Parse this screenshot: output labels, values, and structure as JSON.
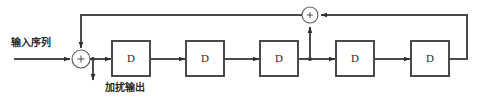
{
  "diagram": {
    "type": "scrambler-block-diagram",
    "title": "",
    "labels": {
      "input_sequence": "输入序列",
      "scrambled_output": "加扰输出"
    },
    "colors": {
      "background": "#ffffff",
      "wire": "#4a4a4a",
      "box_border": "#4a4a4a",
      "text": "#2a2a2a",
      "junction": "#2e2e2e"
    },
    "adders": [
      {
        "name": "input-adder",
        "sign": "+",
        "cx": 81,
        "cy": 59,
        "r": 9
      },
      {
        "name": "feedback-adder",
        "sign": "+",
        "cx": 310,
        "cy": 15,
        "r": 8
      }
    ],
    "delay_blocks": [
      {
        "name": "delay-1",
        "label": "D",
        "x": 112,
        "y": 41,
        "w": 38,
        "h": 35
      },
      {
        "name": "delay-2",
        "label": "D",
        "x": 186,
        "y": 41,
        "w": 38,
        "h": 35
      },
      {
        "name": "delay-3",
        "label": "D",
        "x": 260,
        "y": 41,
        "w": 38,
        "h": 35
      },
      {
        "name": "delay-4",
        "label": "D",
        "x": 336,
        "y": 41,
        "w": 38,
        "h": 35
      },
      {
        "name": "delay-5",
        "label": "D",
        "x": 411,
        "y": 41,
        "w": 38,
        "h": 35
      }
    ],
    "junctions": [
      {
        "name": "output-tap-junction",
        "cx": 93,
        "cy": 59
      },
      {
        "name": "stage3-tap-junction",
        "cx": 310,
        "cy": 59
      }
    ],
    "signal_line_y": 59,
    "feedback_line_y": 15
  }
}
